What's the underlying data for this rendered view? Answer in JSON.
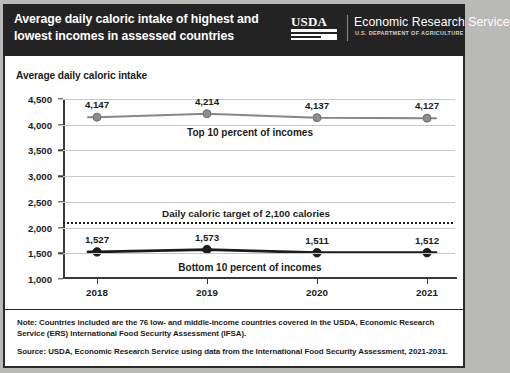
{
  "header": {
    "title": "Average daily caloric intake of highest and lowest incomes in assessed countries",
    "logo_wordmark": "USDA",
    "agency_name": "Economic Research Service",
    "agency_sub": "U.S. DEPARTMENT OF AGRICULTURE",
    "band_color": "#232323"
  },
  "footer": {
    "note": "Note: Countries included are the 76 low- and middle-income countries covered in the USDA, Economic Research Service (ERS) International Food Security Assessment (IFSA).",
    "source": "Source: USDA, Economic Research Service using data from the International Food Security Assessment, 2021-2031."
  },
  "chart_data": {
    "type": "line",
    "title": "Average daily caloric intake of highest and lowest incomes in assessed countries",
    "subtitle": "Average daily caloric intake",
    "xlabel": "",
    "ylabel": "Average daily caloric intake",
    "categories": [
      "2018",
      "2019",
      "2020",
      "2021"
    ],
    "ylim": [
      1000,
      4500
    ],
    "yticks": [
      "1,000",
      "1,500",
      "2,000",
      "2,500",
      "3,000",
      "3,500",
      "4,000",
      "4,500"
    ],
    "ytick_values": [
      1000,
      1500,
      2000,
      2500,
      3000,
      3500,
      4000,
      4500
    ],
    "grid": true,
    "legend_position": "inline-annotation",
    "series": [
      {
        "name": "Top 10 percent of incomes",
        "values": [
          4147,
          4214,
          4137,
          4127
        ],
        "labels": [
          "4,147",
          "4,214",
          "4,137",
          "4,127"
        ],
        "color": "#878787",
        "marker_color": "#8d8d8d"
      },
      {
        "name": "Bottom 10 percent of incomes",
        "values": [
          1527,
          1573,
          1511,
          1512
        ],
        "labels": [
          "1,527",
          "1,573",
          "1,511",
          "1,512"
        ],
        "color": "#1b1b1b",
        "marker_color": "#1b1b1b"
      }
    ],
    "reference_line": {
      "label": "Daily caloric target of 2,100 calories",
      "value": 2100,
      "style": "dotted",
      "color": "#1b1b1b"
    }
  }
}
